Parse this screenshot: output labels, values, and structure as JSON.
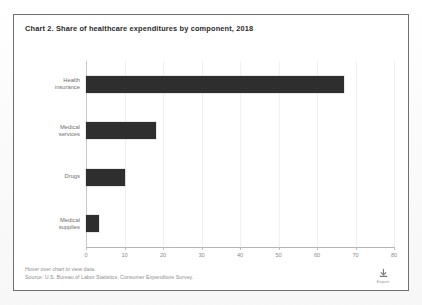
{
  "chart_title": "Chart 2. Share of healthcare expenditures by component, 2018",
  "footer": {
    "hover_hint": "Hover over chart to view data.",
    "source": "Source: U.S. Bureau of Labor Statistics, Consumer Expenditure Survey."
  },
  "download": {
    "icon": "download-icon",
    "label": "Export"
  },
  "colors": {
    "bar": "#2e2e2e",
    "axis": "#b4b4b4",
    "grid": "#f0f0f0",
    "card_border": "#6f6f6f",
    "title_text": "#2b2b2b",
    "label_text": "#6e6e6e",
    "footer_text": "#8f8f8f"
  },
  "chart_data": {
    "type": "bar",
    "orientation": "horizontal",
    "title": "Chart 2. Share of healthcare expenditures by component, 2018",
    "categories": [
      "Health\ninsurance",
      "Medical\nservices",
      "Drugs",
      "Medical\nsupplies"
    ],
    "values": [
      67.0,
      18.2,
      10.0,
      3.5
    ],
    "xlabel": "",
    "ylabel": "",
    "xlim": [
      0,
      80
    ],
    "ylim": null,
    "xticks": [
      0,
      10,
      20,
      30,
      40,
      50,
      60,
      70,
      80
    ],
    "xticklabels": [
      "0",
      "10",
      "20",
      "30",
      "40",
      "50",
      "60",
      "70",
      "80"
    ],
    "grid": true,
    "legend": null,
    "series": [
      {
        "name": "Share of healthcare expenditures",
        "values": [
          67.0,
          18.2,
          10.0,
          3.5
        ]
      }
    ]
  }
}
